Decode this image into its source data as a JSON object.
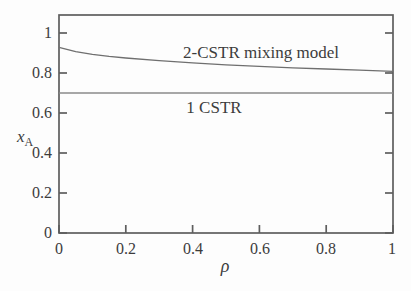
{
  "figure": {
    "background": "#fdfdfd",
    "frame_color": "#5e5e5e",
    "tick_color": "#5e5e5e",
    "text_color": "#3c3c3c"
  },
  "chart_data": {
    "type": "line",
    "title": "",
    "xlabel": "ρ",
    "ylabel_base": "x",
    "ylabel_sub": "A",
    "xlim": [
      0,
      1
    ],
    "ylim": [
      0,
      1.09
    ],
    "xticks": [
      0,
      0.2,
      0.4,
      0.6,
      0.8,
      1
    ],
    "yticks": [
      0,
      0.2,
      0.4,
      0.6,
      0.8,
      1
    ],
    "xtick_labels": [
      "0",
      "0.2",
      "0.4",
      "0.6",
      "0.8",
      "1"
    ],
    "ytick_labels": [
      "0",
      "0.2",
      "0.4",
      "0.6",
      "0.8",
      "1"
    ],
    "grid": false,
    "legend": "inline-annotations",
    "series": [
      {
        "name": "2-CSTR mixing model",
        "color": "#6f6f6f",
        "x": [
          0,
          0.05,
          0.1,
          0.15,
          0.2,
          0.3,
          0.4,
          0.5,
          0.6,
          0.7,
          0.8,
          0.9,
          1.0
        ],
        "y": [
          0.928,
          0.907,
          0.893,
          0.883,
          0.875,
          0.862,
          0.851,
          0.841,
          0.833,
          0.826,
          0.82,
          0.814,
          0.808
        ]
      },
      {
        "name": "1 CSTR",
        "color": "#8a8a8a",
        "x": [
          0,
          1.0
        ],
        "y": [
          0.7,
          0.7
        ]
      }
    ],
    "annotations": [
      {
        "text": "2-CSTR mixing model"
      },
      {
        "text": "1 CSTR"
      }
    ]
  }
}
